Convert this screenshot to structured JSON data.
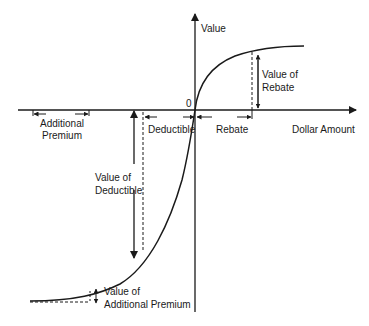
{
  "diagram": {
    "type": "value-function",
    "axes": {
      "y_label": "Value",
      "x_label": "Dollar Amount",
      "origin_label": "0"
    },
    "labels": {
      "value_of_rebate_line1": "Value of",
      "value_of_rebate_line2": "Rebate",
      "rebate": "Rebate",
      "deductible": "Deductible",
      "additional_premium_line1": "Additional",
      "additional_premium_line2": "Premium",
      "value_of_deductible_line1": "Value of",
      "value_of_deductible_line2": "Deductible",
      "value_of_additional_premium_line1": "Value of",
      "value_of_additional_premium_line2": "Additional Premium"
    },
    "colors": {
      "line": "#1a1a1a",
      "background": "#ffffff"
    }
  }
}
